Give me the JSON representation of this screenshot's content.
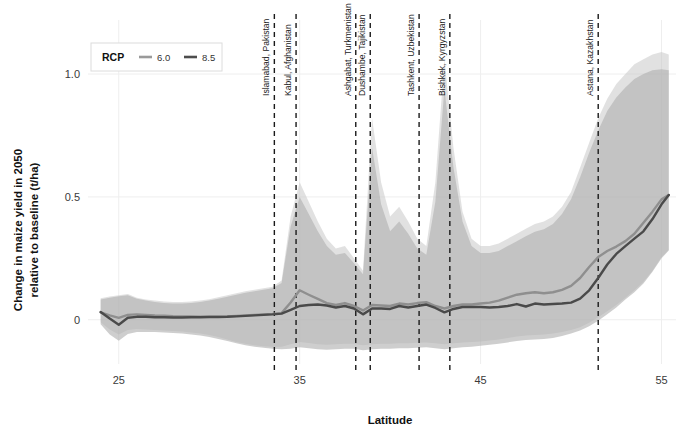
{
  "chart_data": {
    "type": "line",
    "title": "",
    "xlabel": "Latitude",
    "ylabel": "Change in maize yield in 2050 relative to baseline (t/ha)",
    "ylabel_line1": "Change in maize yield in 2050",
    "ylabel_line2": "relative to baseline (t/ha)",
    "xlim": [
      23.3,
      55.8
    ],
    "ylim": [
      -0.18,
      1.22
    ],
    "xticks": [
      25,
      35,
      45,
      55
    ],
    "xtick_labels": [
      "25",
      "35",
      "45",
      "55"
    ],
    "yticks": [
      0,
      0.5,
      1.0
    ],
    "ytick_labels": [
      "0",
      "0.5",
      "1.0"
    ],
    "grid": true,
    "grid_color": "#eeeeee",
    "legend": {
      "title": "RCP",
      "position": "top-left",
      "entries": [
        {
          "label": "6.0",
          "color": "#9a9a9a"
        },
        {
          "label": "8.5",
          "color": "#4d4d4d"
        }
      ]
    },
    "annotations": [
      {
        "label": "Islamabad, Pakistan",
        "x": 33.6
      },
      {
        "label": "Kabul, Afghanistan",
        "x": 34.8
      },
      {
        "label": "Ashgabat, Turkmenistan",
        "x": 38.1
      },
      {
        "label": "Dushambe, Tajikistan",
        "x": 38.9
      },
      {
        "label": "Tashkent, Uzbekistan",
        "x": 41.6
      },
      {
        "label": "Bishkek, Kyrgyzstan",
        "x": 43.3
      },
      {
        "label": "Astana, Kazakhstan",
        "x": 51.5
      }
    ],
    "x": [
      24.0,
      24.5,
      25.0,
      25.5,
      26.0,
      26.5,
      27.0,
      27.5,
      28.0,
      28.5,
      29.0,
      29.5,
      30.0,
      30.5,
      31.0,
      31.5,
      32.0,
      32.5,
      33.0,
      33.5,
      34.0,
      34.5,
      35.0,
      35.5,
      36.0,
      36.5,
      37.0,
      37.5,
      38.0,
      38.5,
      39.0,
      39.5,
      40.0,
      40.5,
      41.0,
      41.5,
      42.0,
      42.5,
      43.0,
      43.5,
      44.0,
      44.5,
      45.0,
      45.5,
      46.0,
      46.5,
      47.0,
      47.5,
      48.0,
      48.5,
      49.0,
      49.5,
      50.0,
      50.5,
      51.0,
      51.5,
      52.0,
      52.5,
      53.0,
      53.5,
      54.0,
      54.5,
      55.0,
      55.4
    ],
    "series": [
      {
        "name": "6.0",
        "color": "#8f8f8f",
        "band_color": "#c9c9c9",
        "values": [
          0.03,
          0.018,
          0.008,
          0.02,
          0.022,
          0.02,
          0.018,
          0.017,
          0.015,
          0.014,
          0.014,
          0.013,
          0.013,
          0.013,
          0.014,
          0.016,
          0.018,
          0.02,
          0.022,
          0.024,
          0.027,
          0.07,
          0.12,
          0.102,
          0.085,
          0.068,
          0.06,
          0.068,
          0.056,
          0.038,
          0.06,
          0.058,
          0.056,
          0.066,
          0.062,
          0.068,
          0.072,
          0.056,
          0.046,
          0.056,
          0.062,
          0.062,
          0.066,
          0.07,
          0.078,
          0.09,
          0.102,
          0.108,
          0.112,
          0.108,
          0.112,
          0.122,
          0.138,
          0.17,
          0.215,
          0.255,
          0.28,
          0.298,
          0.32,
          0.35,
          0.395,
          0.44,
          0.49,
          0.508
        ],
        "lower": [
          -0.01,
          -0.04,
          -0.06,
          -0.042,
          -0.038,
          -0.04,
          -0.042,
          -0.044,
          -0.046,
          -0.048,
          -0.052,
          -0.056,
          -0.062,
          -0.07,
          -0.08,
          -0.09,
          -0.098,
          -0.104,
          -0.108,
          -0.11,
          -0.11,
          -0.1,
          -0.09,
          -0.095,
          -0.1,
          -0.102,
          -0.1,
          -0.098,
          -0.098,
          -0.104,
          -0.1,
          -0.098,
          -0.098,
          -0.096,
          -0.096,
          -0.094,
          -0.092,
          -0.096,
          -0.1,
          -0.096,
          -0.092,
          -0.09,
          -0.088,
          -0.084,
          -0.08,
          -0.074,
          -0.068,
          -0.064,
          -0.062,
          -0.06,
          -0.056,
          -0.05,
          -0.042,
          -0.03,
          -0.012,
          0.01,
          0.035,
          0.06,
          0.09,
          0.12,
          0.155,
          0.2,
          0.255,
          0.285
        ],
        "upper": [
          0.088,
          0.095,
          0.1,
          0.105,
          0.09,
          0.082,
          0.078,
          0.074,
          0.072,
          0.072,
          0.074,
          0.078,
          0.084,
          0.092,
          0.1,
          0.108,
          0.116,
          0.122,
          0.128,
          0.134,
          0.16,
          0.42,
          0.56,
          0.48,
          0.4,
          0.33,
          0.29,
          0.3,
          0.25,
          0.2,
          0.82,
          0.56,
          0.42,
          0.46,
          0.4,
          0.33,
          0.3,
          0.56,
          1.06,
          0.7,
          0.44,
          0.33,
          0.3,
          0.3,
          0.31,
          0.33,
          0.35,
          0.37,
          0.39,
          0.4,
          0.42,
          0.46,
          0.52,
          0.62,
          0.72,
          0.82,
          0.9,
          0.96,
          1.0,
          1.04,
          1.06,
          1.08,
          1.09,
          1.08
        ]
      },
      {
        "name": "8.5",
        "color": "#4a4a4a",
        "band_color": "#b0b0b0",
        "values": [
          0.032,
          0.005,
          -0.02,
          0.008,
          0.012,
          0.012,
          0.01,
          0.01,
          0.009,
          0.009,
          0.01,
          0.01,
          0.011,
          0.011,
          0.012,
          0.014,
          0.016,
          0.018,
          0.02,
          0.022,
          0.025,
          0.04,
          0.056,
          0.06,
          0.062,
          0.058,
          0.05,
          0.056,
          0.046,
          0.022,
          0.046,
          0.046,
          0.044,
          0.056,
          0.05,
          0.056,
          0.062,
          0.048,
          0.03,
          0.044,
          0.052,
          0.052,
          0.052,
          0.05,
          0.052,
          0.056,
          0.064,
          0.054,
          0.066,
          0.062,
          0.064,
          0.066,
          0.07,
          0.086,
          0.12,
          0.17,
          0.225,
          0.268,
          0.3,
          0.33,
          0.36,
          0.41,
          0.47,
          0.508
        ],
        "lower": [
          -0.018,
          -0.06,
          -0.085,
          -0.058,
          -0.05,
          -0.05,
          -0.05,
          -0.052,
          -0.054,
          -0.056,
          -0.06,
          -0.064,
          -0.07,
          -0.078,
          -0.086,
          -0.096,
          -0.104,
          -0.11,
          -0.114,
          -0.118,
          -0.12,
          -0.118,
          -0.112,
          -0.116,
          -0.12,
          -0.122,
          -0.12,
          -0.118,
          -0.118,
          -0.124,
          -0.12,
          -0.118,
          -0.118,
          -0.116,
          -0.116,
          -0.114,
          -0.112,
          -0.116,
          -0.12,
          -0.116,
          -0.112,
          -0.11,
          -0.106,
          -0.102,
          -0.098,
          -0.092,
          -0.086,
          -0.082,
          -0.08,
          -0.078,
          -0.074,
          -0.066,
          -0.056,
          -0.044,
          -0.026,
          -0.004,
          0.022,
          0.05,
          0.082,
          0.112,
          0.148,
          0.195,
          0.25,
          0.282
        ],
        "upper": [
          0.082,
          0.09,
          0.096,
          0.1,
          0.086,
          0.078,
          0.072,
          0.068,
          0.066,
          0.066,
          0.068,
          0.072,
          0.078,
          0.086,
          0.094,
          0.102,
          0.11,
          0.116,
          0.122,
          0.128,
          0.15,
          0.38,
          0.5,
          0.43,
          0.36,
          0.3,
          0.265,
          0.272,
          0.23,
          0.185,
          0.7,
          0.47,
          0.36,
          0.4,
          0.35,
          0.29,
          0.265,
          0.48,
          0.94,
          0.62,
          0.4,
          0.3,
          0.272,
          0.272,
          0.28,
          0.3,
          0.32,
          0.34,
          0.358,
          0.368,
          0.39,
          0.43,
          0.49,
          0.58,
          0.68,
          0.77,
          0.85,
          0.905,
          0.945,
          0.98,
          1.0,
          1.015,
          1.02,
          1.015
        ]
      }
    ]
  }
}
